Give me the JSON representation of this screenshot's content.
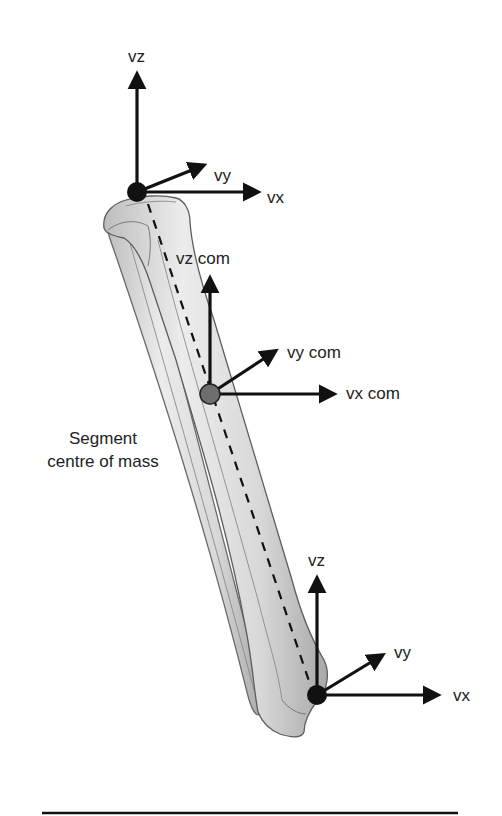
{
  "diagram": {
    "proximal_joint": {
      "labels": {
        "vz": "vz",
        "vy": "vy",
        "vx": "vx"
      },
      "marker_color": "#111111"
    },
    "centre_of_mass": {
      "labels": {
        "vz": "vz com",
        "vy": "vy com",
        "vx": "vx com"
      },
      "marker_color": "#6e6e6e",
      "caption_line1": "Segment",
      "caption_line2": "centre of mass"
    },
    "distal_joint": {
      "labels": {
        "vz": "vz",
        "vy": "vy",
        "vx": "vx"
      },
      "marker_color": "#111111"
    },
    "colors": {
      "arrow": "#111111",
      "bone_fill": "#dcdcdc",
      "bone_outline": "#6a6a6a",
      "background": "#ffffff"
    }
  }
}
